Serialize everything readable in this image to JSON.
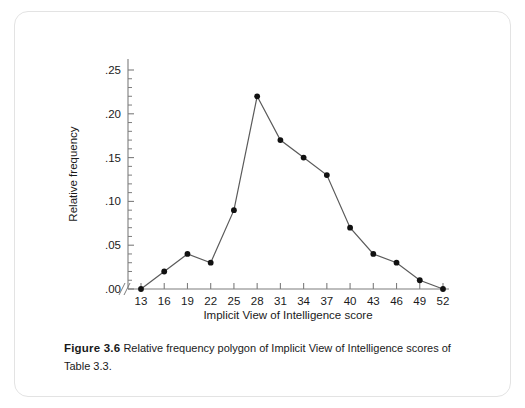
{
  "caption": {
    "label": "Figure 3.6",
    "text": "Relative frequency polygon of Implicit View of Intelligence scores of Table 3.3."
  },
  "chart_data": {
    "type": "line",
    "title": "",
    "xlabel": "Implicit View of Intelligence score",
    "ylabel": "Relative frequency",
    "x": [
      13,
      16,
      19,
      22,
      25,
      28,
      31,
      34,
      37,
      40,
      43,
      46,
      49,
      52
    ],
    "values": [
      0.0,
      0.02,
      0.04,
      0.03,
      0.09,
      0.22,
      0.17,
      0.15,
      0.13,
      0.07,
      0.04,
      0.03,
      0.01,
      0.0
    ],
    "xtick_labels": [
      "13",
      "16",
      "19",
      "22",
      "25",
      "28",
      "31",
      "34",
      "37",
      "40",
      "43",
      "46",
      "49",
      "52"
    ],
    "ytick_labels": [
      ".00",
      ".05",
      ".10",
      ".15",
      ".20",
      ".25"
    ],
    "ytick_values": [
      0.0,
      0.05,
      0.1,
      0.15,
      0.2,
      0.25
    ],
    "ylim": [
      0,
      0.25
    ],
    "xlim": [
      13,
      52
    ],
    "grid": false,
    "legend": false,
    "axis_break": "//",
    "marker": "filled-circle",
    "line_color": "#5a5a5a",
    "marker_color": "#111111",
    "axis_color": "#7d7d7d",
    "minor_ticks_per_interval": 5
  }
}
